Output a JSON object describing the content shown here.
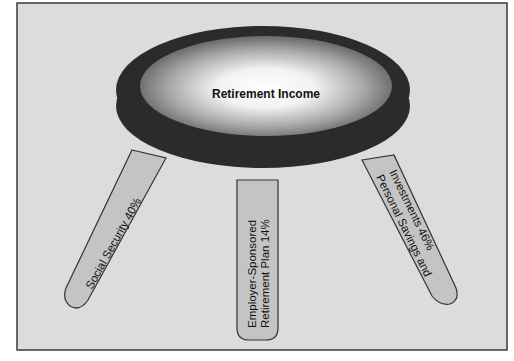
{
  "diagram": {
    "title": "Retirement Income",
    "legs": [
      {
        "label": "Social Security 40%",
        "lines": [
          "Social Security 40%"
        ]
      },
      {
        "label": "Employer-Sponsored Retirement Plan 14%",
        "lines": [
          "Employer-Sponsored",
          "Retirement Plan 14%"
        ]
      },
      {
        "label": "Personal Savings and Investments 46%",
        "lines": [
          "Personal Savings and",
          "Investments 46%"
        ]
      }
    ]
  },
  "colors": {
    "background": "#dcdcdc",
    "frame": "#3a3a3a",
    "seat_rim": "#2b2b2b",
    "seat_center": "#ffffff",
    "seat_edge": "#6a6a6a",
    "leg_fill": "#c4c4c4",
    "leg_stroke": "#333333",
    "text": "#111111"
  }
}
